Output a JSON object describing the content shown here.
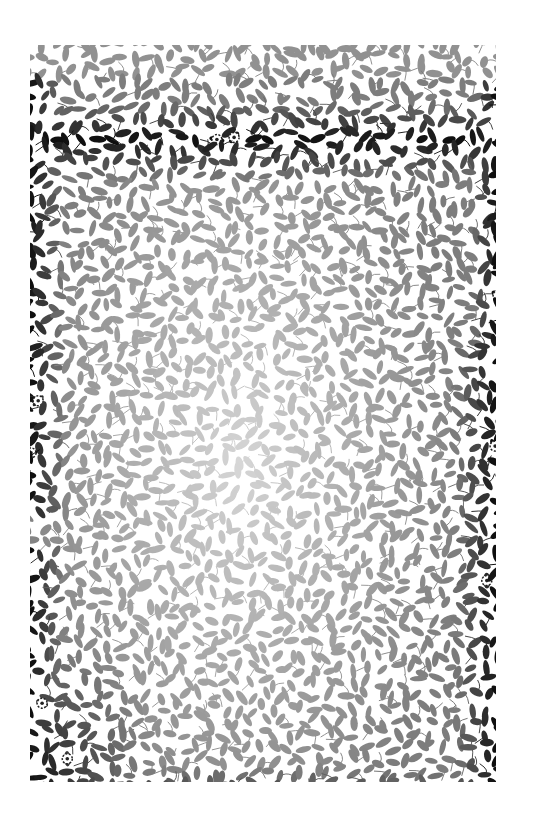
{
  "image": {
    "description": "Decorative floral vine and leaf pattern printed sheet, dense black leaves at the borders fading to light gray in the center",
    "background_color": "#ffffff",
    "ink_color": "#111111",
    "panel": {
      "x": 30,
      "y": 45,
      "width": 466,
      "height": 737
    },
    "motifs": [
      "leaf",
      "vine",
      "rosette-flower"
    ],
    "seed": 7
  }
}
